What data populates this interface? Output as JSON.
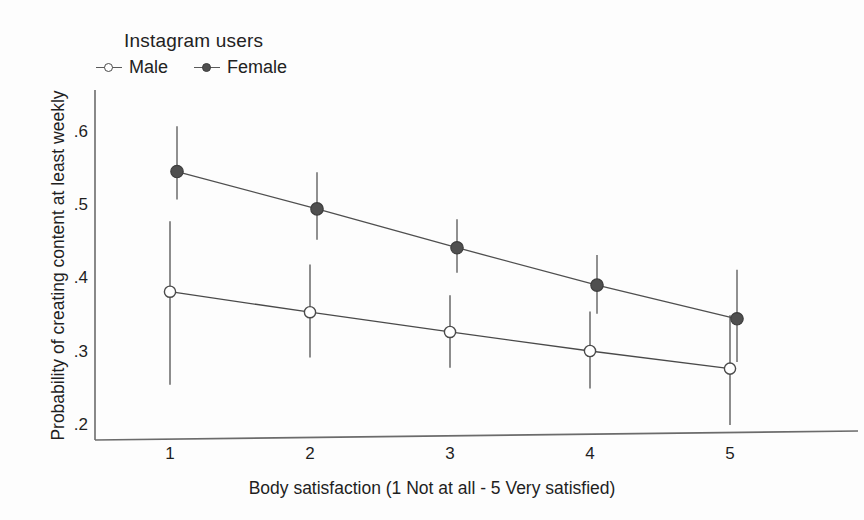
{
  "chart_data": {
    "type": "line",
    "title": "",
    "subtitle": "",
    "xlabel": "Body satisfaction (1 Not at all - 5 Very satisfied)",
    "ylabel": "Probability of creating content at least weekly",
    "legend_title": "Instagram users",
    "legend_position": "top-left",
    "grid": false,
    "x": [
      1,
      2,
      3,
      4,
      5
    ],
    "xtick_labels": [
      "1",
      "2",
      "3",
      "4",
      "5"
    ],
    "ytick_labels": [
      ".6",
      ".5",
      ".4",
      ".3",
      ".2"
    ],
    "ytick_values": [
      0.6,
      0.5,
      0.4,
      0.3,
      0.2
    ],
    "xlim": [
      0.6,
      5.4
    ],
    "ylim": [
      0.17,
      0.645
    ],
    "error_bars": "95% confidence interval",
    "series": [
      {
        "name": "Male",
        "marker": "open-circle",
        "color": "#4a4a4a",
        "values": [
          0.382,
          0.354,
          0.327,
          0.301,
          0.277
        ],
        "ci_low": [
          0.255,
          0.292,
          0.278,
          0.25,
          0.2
        ],
        "ci_high": [
          0.478,
          0.419,
          0.377,
          0.355,
          0.35
        ]
      },
      {
        "name": "Female",
        "marker": "filled-circle",
        "color": "#4f4f4f",
        "values": [
          0.546,
          0.495,
          0.442,
          0.391,
          0.345
        ],
        "ci_low": [
          0.508,
          0.453,
          0.408,
          0.352,
          0.286
        ],
        "ci_high": [
          0.608,
          0.545,
          0.481,
          0.432,
          0.412
        ]
      }
    ]
  },
  "legend": {
    "title": "Instagram users",
    "entries": [
      {
        "label": "Male",
        "marker": "open-circle"
      },
      {
        "label": "Female",
        "marker": "filled-circle"
      }
    ]
  },
  "axes": {
    "y_title": "Probability of creating content at least weekly",
    "x_title": "Body satisfaction (1 Not at all - 5 Very satisfied)",
    "y_ticks": [
      ".6",
      ".5",
      ".4",
      ".3",
      ".2"
    ],
    "x_ticks": [
      "1",
      "2",
      "3",
      "4",
      "5"
    ]
  },
  "colors": {
    "axis": "#6b6b6b",
    "male": "#4a4a4a",
    "female": "#4f4f4f",
    "background": "#fdfdfd",
    "text": "#1f1f1f"
  }
}
